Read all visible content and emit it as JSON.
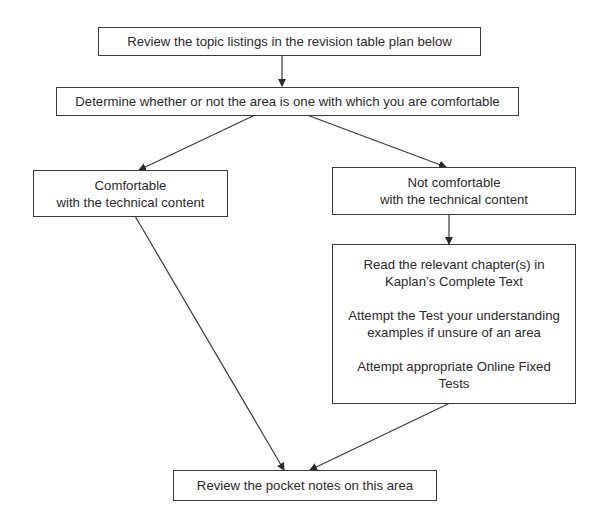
{
  "flowchart": {
    "nodes": {
      "review_topics": {
        "lines": [
          "Review the topic listings in the revision table plan below"
        ]
      },
      "determine_comfort": {
        "lines": [
          "Determine whether or not the area is one with which you are comfortable"
        ]
      },
      "comfortable": {
        "lines": [
          "Comfortable",
          "with the technical content"
        ]
      },
      "not_comfortable": {
        "lines": [
          "Not comfortable",
          "with the technical content"
        ]
      },
      "study_actions": {
        "paragraphs": [
          [
            "Read the relevant chapter(s) in",
            "Kaplan’s Complete Text"
          ],
          [
            "Attempt the Test your understanding",
            "examples if unsure of an area"
          ],
          [
            "Attempt appropriate Online Fixed",
            "Tests"
          ]
        ]
      },
      "review_pocket_notes": {
        "lines": [
          "Review the pocket notes on this area"
        ]
      }
    },
    "edges": [
      {
        "from": "review_topics",
        "to": "determine_comfort"
      },
      {
        "from": "determine_comfort",
        "to": "comfortable"
      },
      {
        "from": "determine_comfort",
        "to": "not_comfortable"
      },
      {
        "from": "not_comfortable",
        "to": "study_actions"
      },
      {
        "from": "comfortable",
        "to": "review_pocket_notes"
      },
      {
        "from": "study_actions",
        "to": "review_pocket_notes"
      }
    ],
    "colors": {
      "line": "#3a3a3a",
      "text": "#2a2a2a",
      "background": "#ffffff"
    }
  }
}
